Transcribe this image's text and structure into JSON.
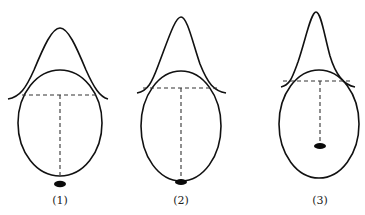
{
  "figures": [
    {
      "label": "(1)",
      "description": "Bell curve above ellipse; dashed vertical reaches bottom of ellipse; dark spot just below ellipse"
    },
    {
      "label": "(2)",
      "description": "Narrower bell curve above ellipse; dashed vertical reaches bottom; dark spot at ellipse bottom edge"
    },
    {
      "label": "(3)",
      "description": "Narrowest bell curve above ellipse; dashed vertical ends inside ellipse at dark spot"
    }
  ],
  "colors": {
    "line": "#111111",
    "dash": "#333333",
    "background": "#ffffff"
  }
}
